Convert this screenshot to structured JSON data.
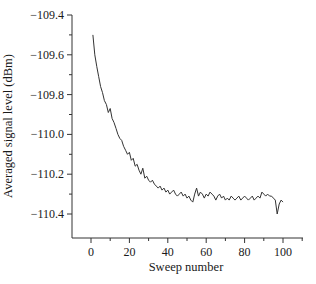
{
  "chart_data": {
    "type": "line",
    "title": "",
    "xlabel": "Sweep number",
    "ylabel": "Averaged signal level (dBm)",
    "xlim": [
      -10,
      110
    ],
    "ylim": [
      -110.5,
      -109.4
    ],
    "x_ticks": [
      0,
      20,
      40,
      60,
      80,
      100
    ],
    "x_tick_labels": [
      "0",
      "20",
      "40",
      "60",
      "80",
      "100"
    ],
    "y_ticks": [
      -109.4,
      -109.6,
      -109.8,
      -110.0,
      -110.2,
      -110.4
    ],
    "y_tick_labels": [
      "−109.4",
      "−109.6",
      "−109.8",
      "−110.0",
      "−110.2",
      "−110.4"
    ],
    "grid": false,
    "legend": null,
    "series": [
      {
        "name": "Averaged signal level",
        "color": "#333333",
        "x": [
          1,
          2,
          3,
          4,
          5,
          6,
          7,
          8,
          9,
          10,
          11,
          12,
          13,
          14,
          15,
          16,
          17,
          18,
          19,
          20,
          21,
          22,
          23,
          24,
          25,
          26,
          27,
          28,
          29,
          30,
          31,
          32,
          33,
          34,
          35,
          36,
          37,
          38,
          39,
          40,
          41,
          42,
          43,
          44,
          45,
          46,
          47,
          48,
          49,
          50,
          51,
          52,
          53,
          54,
          55,
          56,
          57,
          58,
          59,
          60,
          61,
          62,
          63,
          64,
          65,
          66,
          67,
          68,
          69,
          70,
          71,
          72,
          73,
          74,
          75,
          76,
          77,
          78,
          79,
          80,
          81,
          82,
          83,
          84,
          85,
          86,
          87,
          88,
          89,
          90,
          91,
          92,
          93,
          94,
          95,
          96,
          97,
          98,
          99,
          100
        ],
        "values": [
          -109.5,
          -109.6,
          -109.66,
          -109.71,
          -109.76,
          -109.79,
          -109.83,
          -109.85,
          -109.89,
          -109.87,
          -109.92,
          -109.94,
          -109.97,
          -110.0,
          -110.02,
          -110.03,
          -110.06,
          -110.08,
          -110.1,
          -110.09,
          -110.13,
          -110.12,
          -110.16,
          -110.15,
          -110.18,
          -110.2,
          -110.17,
          -110.22,
          -110.21,
          -110.23,
          -110.24,
          -110.23,
          -110.25,
          -110.26,
          -110.27,
          -110.26,
          -110.28,
          -110.27,
          -110.29,
          -110.28,
          -110.3,
          -110.29,
          -110.28,
          -110.3,
          -110.31,
          -110.3,
          -110.29,
          -110.31,
          -110.3,
          -110.32,
          -110.31,
          -110.33,
          -110.34,
          -110.3,
          -110.27,
          -110.31,
          -110.29,
          -110.3,
          -110.32,
          -110.3,
          -110.31,
          -110.29,
          -110.3,
          -110.31,
          -110.33,
          -110.31,
          -110.3,
          -110.32,
          -110.31,
          -110.33,
          -110.32,
          -110.33,
          -110.31,
          -110.32,
          -110.33,
          -110.32,
          -110.31,
          -110.33,
          -110.32,
          -110.31,
          -110.32,
          -110.33,
          -110.32,
          -110.31,
          -110.33,
          -110.32,
          -110.31,
          -110.32,
          -110.29,
          -110.3,
          -110.31,
          -110.3,
          -110.31,
          -110.31,
          -110.32,
          -110.33,
          -110.4,
          -110.35,
          -110.33,
          -110.34
        ]
      }
    ]
  }
}
